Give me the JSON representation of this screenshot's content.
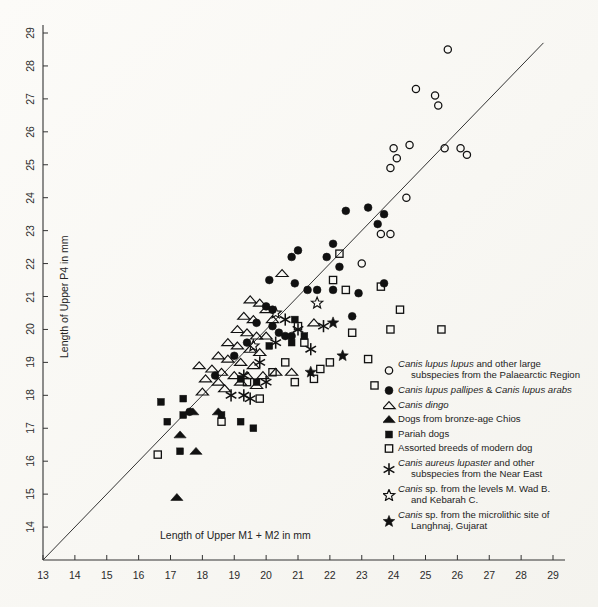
{
  "figure": {
    "xlabel": "Length of Upper M1 + M2 in mm",
    "ylabel": "Length of Upper P4 in mm",
    "line_color": "#333333",
    "axis_color": "#333333",
    "marker_color": "#111111"
  },
  "chart_data": {
    "type": "scatter",
    "title": "",
    "xlabel": "Length of Upper M1 + M2 in mm",
    "ylabel": "Length of Upper P4 in mm",
    "xlim": [
      13,
      29
    ],
    "ylim": [
      13,
      29
    ],
    "xticks": [
      13,
      14,
      15,
      16,
      17,
      18,
      19,
      20,
      21,
      22,
      23,
      24,
      25,
      26,
      27,
      28,
      29
    ],
    "yticks": [
      14,
      15,
      16,
      17,
      18,
      19,
      20,
      21,
      22,
      23,
      24,
      25,
      26,
      27,
      28,
      29
    ],
    "grid": false,
    "legend_position": "lower-right",
    "reference_line": {
      "type": "identity",
      "from": [
        13,
        13
      ],
      "to": [
        28.7,
        28.7
      ]
    },
    "series": [
      {
        "name": "Canis lupus lupus and other large subspecies from the Palaearctic Region",
        "marker": "open-circle",
        "points": [
          [
            25.7,
            28.5
          ],
          [
            24.7,
            27.3
          ],
          [
            25.3,
            27.1
          ],
          [
            25.4,
            26.8
          ],
          [
            24.0,
            25.5
          ],
          [
            24.1,
            25.2
          ],
          [
            23.9,
            24.9
          ],
          [
            26.1,
            25.5
          ],
          [
            25.6,
            25.5
          ],
          [
            26.3,
            25.3
          ],
          [
            24.4,
            24.0
          ],
          [
            23.6,
            22.9
          ],
          [
            23.9,
            22.9
          ],
          [
            23.0,
            22.0
          ],
          [
            24.5,
            25.6
          ]
        ]
      },
      {
        "name": "Canis lupus pallipes & Canis lupus arabs",
        "marker": "filled-circle",
        "points": [
          [
            22.5,
            23.6
          ],
          [
            23.2,
            23.7
          ],
          [
            23.7,
            23.5
          ],
          [
            23.5,
            23.2
          ],
          [
            22.1,
            22.6
          ],
          [
            21.0,
            22.4
          ],
          [
            21.9,
            22.2
          ],
          [
            20.8,
            22.2
          ],
          [
            22.3,
            21.9
          ],
          [
            20.1,
            21.5
          ],
          [
            20.9,
            21.4
          ],
          [
            21.6,
            21.2
          ],
          [
            22.1,
            21.2
          ],
          [
            21.3,
            21.2
          ],
          [
            22.9,
            21.1
          ],
          [
            23.7,
            21.4
          ],
          [
            20.0,
            20.7
          ],
          [
            22.7,
            20.4
          ],
          [
            19.7,
            20.2
          ],
          [
            20.2,
            20.1
          ],
          [
            20.4,
            19.9
          ],
          [
            20.6,
            19.8
          ],
          [
            20.8,
            19.8
          ],
          [
            19.4,
            19.6
          ],
          [
            19.0,
            19.2
          ],
          [
            18.4,
            18.6
          ],
          [
            17.6,
            17.5
          ],
          [
            20.2,
            20.6
          ]
        ]
      },
      {
        "name": "Canis dingo",
        "marker": "open-triangle",
        "points": [
          [
            20.5,
            21.7
          ],
          [
            19.5,
            20.9
          ],
          [
            19.8,
            20.8
          ],
          [
            20.0,
            20.6
          ],
          [
            19.3,
            20.4
          ],
          [
            19.6,
            20.3
          ],
          [
            20.2,
            20.3
          ],
          [
            21.5,
            20.2
          ],
          [
            19.1,
            20.0
          ],
          [
            19.4,
            19.9
          ],
          [
            19.7,
            19.8
          ],
          [
            20.0,
            19.8
          ],
          [
            18.8,
            19.6
          ],
          [
            19.1,
            19.5
          ],
          [
            19.5,
            19.4
          ],
          [
            19.8,
            19.3
          ],
          [
            18.5,
            19.2
          ],
          [
            18.8,
            19.1
          ],
          [
            19.2,
            19.0
          ],
          [
            19.6,
            18.9
          ],
          [
            18.3,
            18.8
          ],
          [
            18.6,
            18.7
          ],
          [
            19.0,
            18.6
          ],
          [
            19.4,
            18.6
          ],
          [
            19.9,
            18.6
          ],
          [
            20.3,
            18.7
          ],
          [
            18.1,
            18.5
          ],
          [
            18.5,
            18.4
          ],
          [
            19.2,
            18.4
          ],
          [
            19.7,
            18.3
          ],
          [
            18.0,
            18.1
          ],
          [
            18.7,
            18.2
          ],
          [
            20.8,
            18.7
          ],
          [
            17.9,
            18.9
          ]
        ]
      },
      {
        "name": "Dogs from bronze-age Chios",
        "marker": "filled-triangle",
        "points": [
          [
            17.7,
            17.5
          ],
          [
            18.5,
            17.5
          ],
          [
            17.3,
            16.8
          ],
          [
            17.8,
            16.3
          ],
          [
            17.2,
            14.9
          ]
        ]
      },
      {
        "name": "Pariah dogs",
        "marker": "filled-square",
        "points": [
          [
            16.7,
            17.8
          ],
          [
            17.4,
            17.9
          ],
          [
            17.4,
            17.4
          ],
          [
            18.6,
            17.4
          ],
          [
            19.2,
            18.5
          ],
          [
            19.2,
            17.2
          ],
          [
            19.7,
            18.4
          ],
          [
            20.1,
            19.5
          ],
          [
            20.8,
            19.6
          ],
          [
            21.2,
            19.8
          ],
          [
            20.9,
            20.3
          ],
          [
            16.9,
            17.2
          ],
          [
            17.3,
            16.3
          ],
          [
            19.6,
            17.0
          ]
        ]
      },
      {
        "name": "Assorted breeds of modern dog",
        "marker": "open-square",
        "points": [
          [
            22.3,
            22.3
          ],
          [
            22.1,
            21.5
          ],
          [
            22.5,
            21.2
          ],
          [
            23.6,
            21.3
          ],
          [
            24.2,
            20.6
          ],
          [
            23.9,
            20.0
          ],
          [
            22.7,
            19.9
          ],
          [
            25.5,
            20.0
          ],
          [
            23.2,
            19.1
          ],
          [
            23.4,
            18.3
          ],
          [
            21.0,
            20.1
          ],
          [
            21.2,
            19.6
          ],
          [
            20.6,
            19.0
          ],
          [
            20.2,
            18.7
          ],
          [
            20.9,
            18.4
          ],
          [
            21.5,
            18.5
          ],
          [
            19.4,
            18.4
          ],
          [
            18.6,
            17.2
          ],
          [
            16.6,
            16.2
          ],
          [
            19.8,
            17.9
          ],
          [
            21.7,
            18.8
          ],
          [
            22.0,
            19.0
          ]
        ]
      },
      {
        "name": "Canis aureus lupaster and other subspecies from the Near East",
        "marker": "asterisk",
        "points": [
          [
            20.6,
            20.3
          ],
          [
            21.0,
            20.0
          ],
          [
            21.8,
            20.1
          ],
          [
            20.3,
            19.6
          ],
          [
            19.8,
            19.0
          ],
          [
            20.0,
            18.4
          ],
          [
            19.3,
            18.0
          ],
          [
            18.9,
            18.0
          ],
          [
            19.5,
            17.9
          ],
          [
            19.3,
            18.6
          ],
          [
            21.4,
            19.4
          ]
        ]
      },
      {
        "name": "Canis sp. from the levels M. Wad B. and Kebarah C.",
        "marker": "open-star",
        "points": [
          [
            20.3,
            20.5
          ],
          [
            21.6,
            20.8
          ],
          [
            19.6,
            19.5
          ]
        ]
      },
      {
        "name": "Canis sp. from the microlithic site of Langhnaj, Gujarat",
        "marker": "filled-star",
        "points": [
          [
            22.1,
            20.2
          ],
          [
            22.4,
            19.2
          ],
          [
            21.4,
            18.7
          ]
        ]
      }
    ]
  },
  "legend": {
    "items": [
      {
        "marker": "open-circle",
        "line1_italic": "Canis lupus lupus",
        "line1_rest": " and other large",
        "line2": "subspecies from the Palaearctic Region"
      },
      {
        "marker": "filled-circle",
        "line1_italic": "Canis lupus pallipes",
        "line1_rest": " & ",
        "line1_italic2": "Canis lupus arabs",
        "line2": ""
      },
      {
        "marker": "open-triangle",
        "line1_italic": "Canis dingo",
        "line1_rest": "",
        "line2": ""
      },
      {
        "marker": "filled-triangle",
        "line1_italic": "",
        "line1_rest": "Dogs from bronze-age Chios",
        "line2": ""
      },
      {
        "marker": "filled-square",
        "line1_italic": "",
        "line1_rest": "Pariah dogs",
        "line2": ""
      },
      {
        "marker": "open-square",
        "line1_italic": "",
        "line1_rest": "Assorted breeds of modern dog",
        "line2": ""
      },
      {
        "marker": "asterisk",
        "line1_italic": "Canis aureus lupaster",
        "line1_rest": " and other",
        "line2": "subspecies from the Near East"
      },
      {
        "marker": "open-star",
        "line1_italic": "Canis",
        "line1_rest": " sp. from the levels M. Wad B.",
        "line2": "and Kebarah C."
      },
      {
        "marker": "filled-star",
        "line1_italic": "Canis",
        "line1_rest": " sp. from the microlithic site of",
        "line2": "Langhnaj, Gujarat"
      }
    ]
  }
}
